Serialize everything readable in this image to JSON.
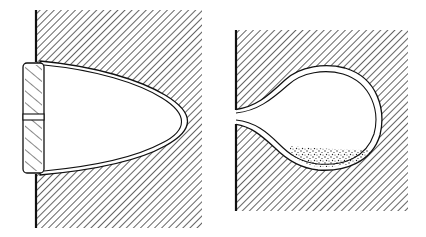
{
  "figure": {
    "description": "Two cross-section drawings of cavities in hatched solid material",
    "panels": [
      {
        "id": "left",
        "label": "Bullet-shaped cavity closed by a hatched plug with a central slot",
        "parts": [
          "hatched-block",
          "bullet-cavity",
          "cavity-lining",
          "plug",
          "plug-slot",
          "wall-edge"
        ]
      },
      {
        "id": "right",
        "label": "Flask-shaped cavity with narrow neck and stippled sediment at bottom",
        "parts": [
          "hatched-block",
          "bulb-cavity",
          "cavity-lining",
          "neck-opening",
          "sediment",
          "wall-edge"
        ]
      }
    ],
    "colors": {
      "ink": "#111111",
      "paper": "#ffffff",
      "sediment": "#333333"
    }
  }
}
